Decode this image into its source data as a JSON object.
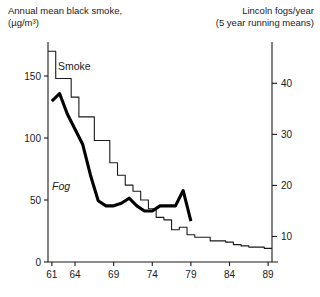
{
  "titles": {
    "left_line1": "Annual mean black smoke,",
    "left_line2": "(µg/m³)",
    "right_line1": "Lincoln fogs/year",
    "right_line2": "(5 year running means)"
  },
  "series_labels": {
    "smoke": "Smoke",
    "fog": "Fog"
  },
  "axes": {
    "left_ticks": [
      "0",
      "50",
      "100",
      "150"
    ],
    "right_ticks": [
      "10",
      "20",
      "30",
      "40"
    ],
    "x_ticks": [
      "61",
      "64",
      "69",
      "74",
      "79",
      "84",
      "89"
    ]
  },
  "colors": {
    "smoke_line": "#1a1a1a",
    "fog_line": "#000000",
    "axis": "#1a1a1a",
    "background": "#ffffff"
  },
  "chart_data": {
    "type": "line",
    "xlabel": "",
    "ylabel": "Annual mean black smoke, (µg/m³)",
    "y2label": "Lincoln fogs/year (5 year running means)",
    "xlim": [
      60.5,
      89.5
    ],
    "ylim": [
      0,
      175
    ],
    "y2lim": [
      5,
      47.5
    ],
    "left_axis_ticks": [
      0,
      50,
      100,
      150
    ],
    "right_axis_ticks": [
      10,
      20,
      30,
      40
    ],
    "x_axis_ticks": [
      61,
      64,
      69,
      74,
      79,
      84,
      89
    ],
    "grid": false,
    "legend": "inline-labels",
    "series": [
      {
        "name": "Smoke",
        "style": "step",
        "axis": "left",
        "units": "µg/m³",
        "x": [
          61,
          62,
          63,
          64,
          65,
          66,
          67,
          68,
          69,
          70,
          71,
          72,
          73,
          74,
          75,
          76,
          77,
          78,
          79,
          80,
          81,
          82,
          83,
          84,
          85,
          86,
          87,
          88,
          89
        ],
        "values": [
          170,
          148,
          148,
          133,
          117,
          117,
          98,
          98,
          80,
          70,
          62,
          57,
          50,
          43,
          36,
          34,
          26,
          28,
          22,
          20,
          20,
          17,
          17,
          16,
          14,
          13,
          12,
          12,
          11
        ]
      },
      {
        "name": "Fog",
        "style": "line",
        "axis": "right",
        "units": "fogs/year",
        "x": [
          61,
          62,
          63,
          64,
          65,
          66,
          67,
          68,
          69,
          70,
          71,
          72,
          73,
          74,
          75,
          76,
          77,
          78,
          79
        ],
        "values": [
          36.5,
          38,
          34,
          31,
          28,
          22,
          17,
          16,
          16,
          16.5,
          17.5,
          16,
          15,
          15,
          16,
          16,
          16,
          19,
          13
        ]
      }
    ]
  }
}
